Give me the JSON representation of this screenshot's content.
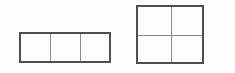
{
  "page": {
    "background_color": "#fdfdfd",
    "width": 235,
    "height": 73
  },
  "style": {
    "outer_border_color": "#4f4f4f",
    "outer_border_width": "2px",
    "inner_divider_color": "#8d8d8d",
    "inner_divider_width": "1px",
    "cell_fill_color": "#fcfcfc"
  },
  "figures": [
    {
      "id": "figure-left",
      "name": "three-part-rectangle",
      "shape": "rectangle",
      "rows": 1,
      "columns": 3,
      "total_cells": 3,
      "position": {
        "x": 19,
        "y": 32
      },
      "size": {
        "width": 92,
        "height": 31
      },
      "cells": [
        {
          "row": 1,
          "column": 1,
          "label": ""
        },
        {
          "row": 1,
          "column": 2,
          "label": ""
        },
        {
          "row": 1,
          "column": 3,
          "label": ""
        }
      ]
    },
    {
      "id": "figure-right",
      "name": "four-part-square",
      "shape": "square",
      "rows": 2,
      "columns": 2,
      "total_cells": 4,
      "position": {
        "x": 136,
        "y": 5
      },
      "size": {
        "width": 68,
        "height": 59
      },
      "cells": [
        {
          "row": 1,
          "column": 1,
          "label": ""
        },
        {
          "row": 1,
          "column": 2,
          "label": ""
        },
        {
          "row": 2,
          "column": 1,
          "label": ""
        },
        {
          "row": 2,
          "column": 2,
          "label": ""
        }
      ]
    }
  ]
}
